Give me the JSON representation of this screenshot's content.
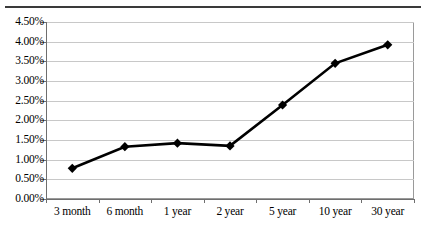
{
  "document": {
    "has_top_rule": true
  },
  "chart_data": {
    "type": "line",
    "title": "",
    "subtitle": "",
    "xlabel": "",
    "ylabel": "",
    "categories": [
      "3 month",
      "6 month",
      "1 year",
      "2 year",
      "5 year",
      "10 year",
      "30 year"
    ],
    "values": [
      0.78,
      1.33,
      1.42,
      1.35,
      2.39,
      3.45,
      3.92
    ],
    "value_format": "percent",
    "ylim": [
      0.0,
      4.5
    ],
    "ytick_step": 0.5,
    "ytick_labels": [
      "0.00%",
      "0.50%",
      "1.00%",
      "1.50%",
      "2.00%",
      "2.50%",
      "3.00%",
      "3.50%",
      "4.00%",
      "4.50%"
    ],
    "ytick_values": [
      0.0,
      0.5,
      1.0,
      1.5,
      2.0,
      2.5,
      3.0,
      3.5,
      4.0,
      4.5
    ],
    "grid": true,
    "grid_axis": "y",
    "legend": false,
    "legend_position": "none",
    "series": [
      {
        "name": "",
        "marker": "diamond",
        "marker_color": "#000000",
        "line_color": "#000000",
        "line_width": 2.6,
        "values": [
          0.78,
          1.33,
          1.42,
          1.35,
          2.39,
          3.45,
          3.92
        ]
      }
    ],
    "colors": {
      "line": "#000000",
      "marker": "#000000",
      "grid": "#c8c8c8",
      "axis": "#6e6e6e",
      "plot_border": "#9a9a9a",
      "background": "#ffffff",
      "text": "#000000"
    }
  }
}
